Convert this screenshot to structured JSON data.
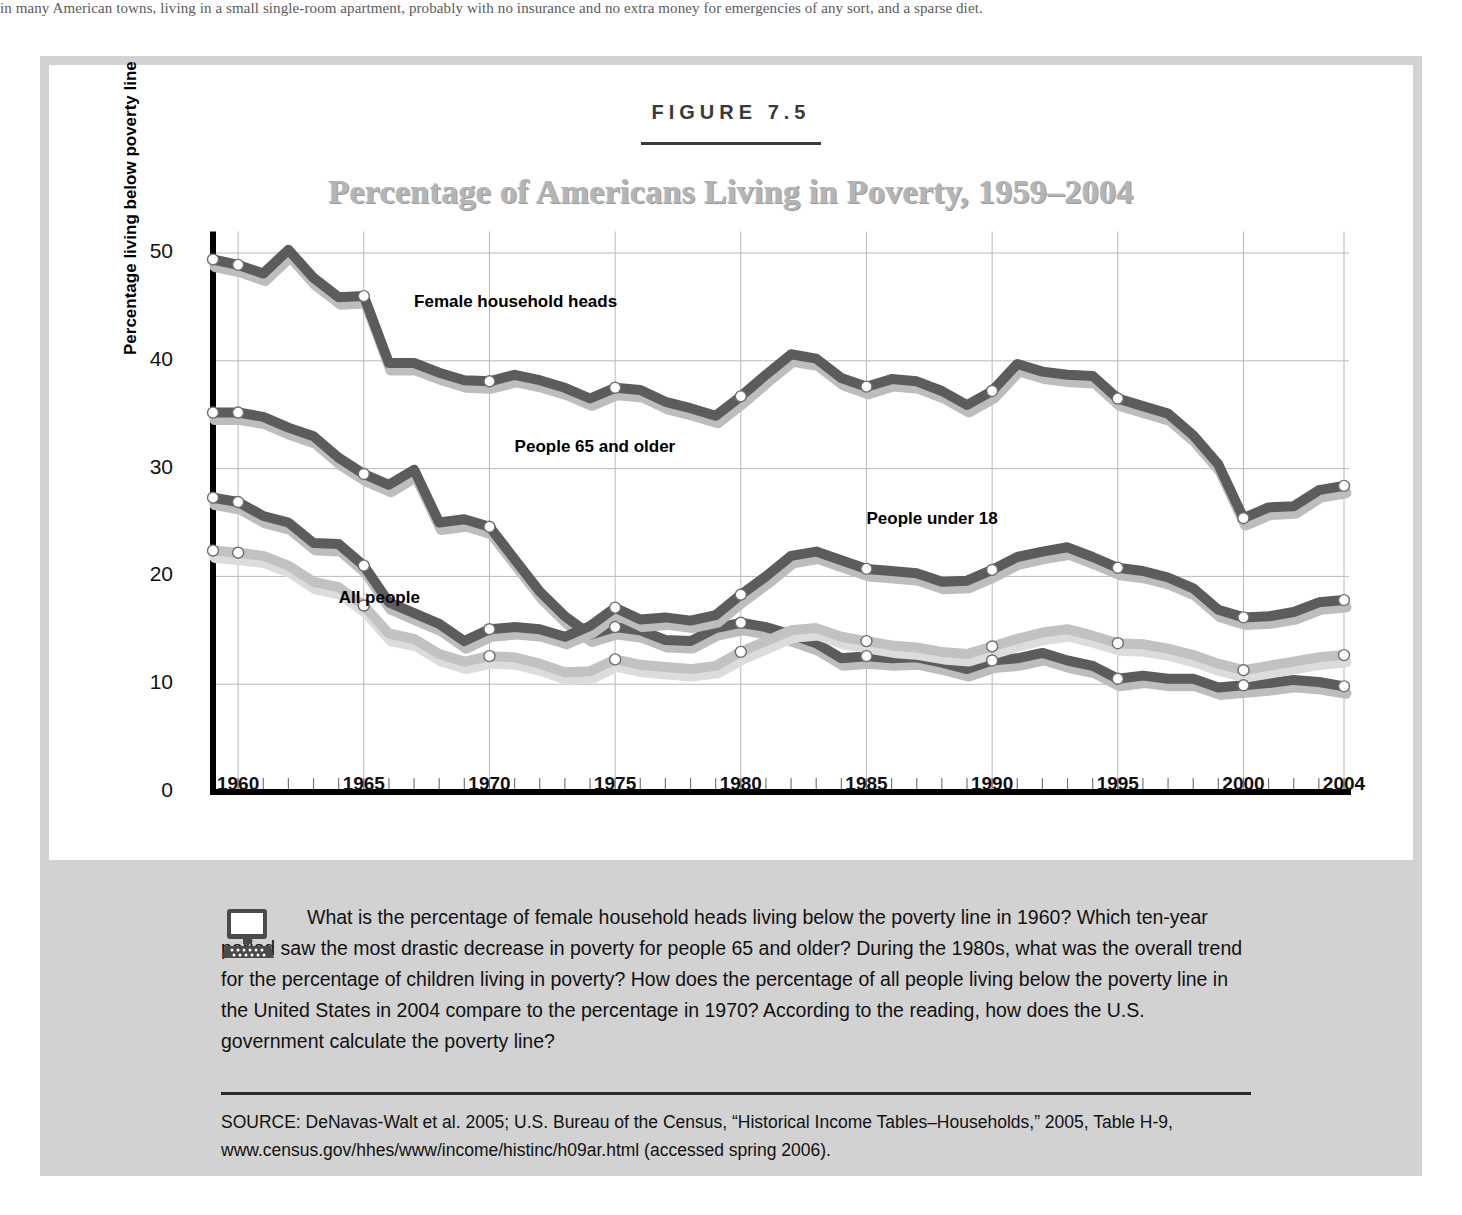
{
  "page": {
    "top_running_text": "in many American towns, living in a small single-room apartment, probably with no insurance and no extra money for emergencies of any sort, and a sparse diet."
  },
  "figure": {
    "label": "FIGURE 7.5",
    "title": "Percentage of Americans Living in Poverty, 1959–2004",
    "frame_color": "#d2d2d2",
    "caption_band_color": "#d2d2d2"
  },
  "caption": {
    "icon": "computer-monitor-icon",
    "text": "What is the percentage of female household heads living below the poverty line in 1960? Which ten-year period saw the most drastic decrease in poverty for people 65 and older? During the 1980s, what was the overall trend for the percentage of children living in poverty? How does the percentage of all people living below the poverty line in the United States in 2004 compare to the percentage in 1970? According to the reading, how does the U.S. government calculate the poverty line?",
    "source": "SOURCE:  DeNavas-Walt et al. 2005; U.S. Bureau of the Census, “Historical Income Tables–Households,” 2005, Table H-9, www.census.gov/hhes/www/income/histinc/h09ar.html (accessed spring 2006)."
  },
  "chart_data": {
    "type": "line",
    "title": "Percentage of Americans Living in Poverty, 1959–2004",
    "xlabel": "",
    "ylabel": "Percentage living below poverty line",
    "xlim": [
      1959,
      2004
    ],
    "ylim": [
      0,
      52
    ],
    "yticks": [
      0,
      10,
      20,
      30,
      40,
      50
    ],
    "xticks": [
      1960,
      1965,
      1970,
      1975,
      1980,
      1985,
      1990,
      1995,
      2000,
      2004
    ],
    "xtick_labels": [
      "1960",
      "1965",
      "1970",
      "1975",
      "1980",
      "1985",
      "1990",
      "1995",
      "2000",
      "2004"
    ],
    "grid": true,
    "legend": "inline-labels",
    "marker_years": [
      1959,
      1960,
      1965,
      1970,
      1975,
      1980,
      1985,
      1990,
      1995,
      2000,
      2004
    ],
    "series_colors": {
      "dark": "#5c5c5c",
      "light": "#c2c2c2"
    },
    "x": [
      1959,
      1960,
      1961,
      1962,
      1963,
      1964,
      1965,
      1966,
      1967,
      1968,
      1969,
      1970,
      1971,
      1972,
      1973,
      1974,
      1975,
      1976,
      1977,
      1978,
      1979,
      1980,
      1981,
      1982,
      1983,
      1984,
      1985,
      1986,
      1987,
      1988,
      1989,
      1990,
      1991,
      1992,
      1993,
      1994,
      1995,
      1996,
      1997,
      1998,
      1999,
      2000,
      2001,
      2002,
      2003,
      2004
    ],
    "series": [
      {
        "name": "Female household heads",
        "color": "#5c5c5c",
        "label_position": {
          "year": 1967,
          "value": 45.5
        },
        "values": [
          49.4,
          48.9,
          48.1,
          50.3,
          47.7,
          45.9,
          46.0,
          39.8,
          39.8,
          38.9,
          38.2,
          38.1,
          38.7,
          38.2,
          37.5,
          36.5,
          37.5,
          37.3,
          36.2,
          35.6,
          34.9,
          36.7,
          38.7,
          40.6,
          40.2,
          38.4,
          37.6,
          38.3,
          38.1,
          37.2,
          35.9,
          37.2,
          39.7,
          39.0,
          38.7,
          38.6,
          36.5,
          35.8,
          35.1,
          33.1,
          30.4,
          25.4,
          26.4,
          26.5,
          28.0,
          28.4
        ]
      },
      {
        "name": "People 65 and older",
        "color": "#5c5c5c",
        "label_position": {
          "year": 1971,
          "value": 32.0
        },
        "values": [
          35.2,
          35.2,
          34.8,
          33.8,
          33.0,
          31.0,
          29.5,
          28.5,
          29.9,
          25.0,
          25.3,
          24.6,
          21.6,
          18.6,
          16.3,
          14.6,
          15.3,
          15.0,
          14.1,
          14.0,
          15.2,
          15.7,
          15.3,
          14.6,
          13.8,
          12.4,
          12.6,
          12.4,
          12.5,
          12.0,
          11.4,
          12.2,
          12.4,
          12.9,
          12.2,
          11.7,
          10.5,
          10.8,
          10.5,
          10.5,
          9.7,
          9.9,
          10.1,
          10.4,
          10.2,
          9.8
        ]
      },
      {
        "name": "People under 18",
        "color": "#5c5c5c",
        "label_position": {
          "year": 1985,
          "value": 25.3
        },
        "values": [
          27.3,
          26.9,
          25.6,
          25.0,
          23.1,
          23.0,
          21.0,
          17.6,
          16.6,
          15.6,
          14.0,
          15.1,
          15.3,
          15.1,
          14.4,
          15.4,
          17.1,
          16.0,
          16.2,
          15.9,
          16.4,
          18.3,
          20.0,
          21.9,
          22.3,
          21.5,
          20.7,
          20.5,
          20.3,
          19.5,
          19.6,
          20.6,
          21.8,
          22.3,
          22.7,
          21.8,
          20.8,
          20.5,
          19.9,
          18.9,
          16.9,
          16.2,
          16.3,
          16.7,
          17.6,
          17.8
        ]
      },
      {
        "name": "All people",
        "color": "#c2c2c2",
        "label_position": {
          "year": 1964,
          "value": 18.0
        },
        "values": [
          22.4,
          22.2,
          21.9,
          21.0,
          19.5,
          19.0,
          17.3,
          14.7,
          14.2,
          12.8,
          12.1,
          12.6,
          12.5,
          11.9,
          11.1,
          11.2,
          12.3,
          11.8,
          11.6,
          11.4,
          11.7,
          13.0,
          14.0,
          15.0,
          15.2,
          14.4,
          14.0,
          13.6,
          13.4,
          13.0,
          12.8,
          13.5,
          14.2,
          14.8,
          15.1,
          14.5,
          13.8,
          13.7,
          13.3,
          12.7,
          11.9,
          11.3,
          11.7,
          12.1,
          12.5,
          12.7
        ]
      }
    ]
  }
}
